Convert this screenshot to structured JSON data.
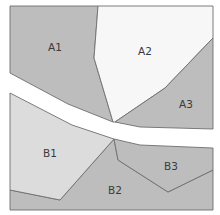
{
  "diagram": {
    "type": "zone-partition-map",
    "colors": {
      "background": "#ffffff",
      "road": "#ffffff",
      "dark_zone": "#bdbdbd",
      "light_zone": "#dcdcdc",
      "white_zone": "#f7f7f7",
      "edge": "#6e6e6e",
      "label": "#3a3a3a"
    },
    "regions": [
      {
        "id": "A1",
        "label": "A1",
        "shade": "dark_zone",
        "label_pos": [
          55,
          48
        ]
      },
      {
        "id": "A2",
        "label": "A2",
        "shade": "white_zone",
        "label_pos": [
          145,
          52
        ]
      },
      {
        "id": "A3",
        "label": "A3",
        "shade": "dark_zone",
        "label_pos": [
          186,
          105
        ]
      },
      {
        "id": "B1",
        "label": "B1",
        "shade": "light_zone",
        "label_pos": [
          50,
          154
        ]
      },
      {
        "id": "B2",
        "label": "B2",
        "shade": "dark_zone",
        "label_pos": [
          115,
          191
        ]
      },
      {
        "id": "B3",
        "label": "B3",
        "shade": "dark_zone",
        "label_pos": [
          171,
          167
        ]
      }
    ],
    "separator": "white diagonal road dividing A zones (top) from B zones (bottom)"
  }
}
